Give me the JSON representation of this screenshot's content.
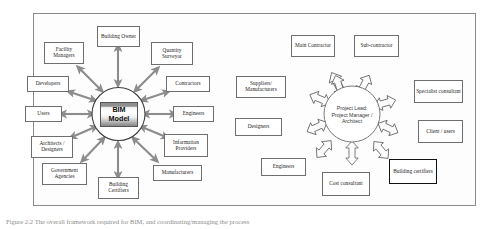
{
  "figure": {
    "caption": "Figure 2.2 The overall framework required for BIM, and coordinating/managing the process"
  },
  "left_diagram": {
    "hub": {
      "label_line1": "BIM",
      "label_line2": "Model"
    },
    "nodes": [
      {
        "id": "building-owner",
        "label": "Building Owner"
      },
      {
        "id": "facility-managers",
        "label": "Facility Managers"
      },
      {
        "id": "quantity-surveyor",
        "label": "Quantity Surveyor"
      },
      {
        "id": "developers",
        "label": "Developers"
      },
      {
        "id": "contractors",
        "label": "Contractors"
      },
      {
        "id": "users",
        "label": "Users"
      },
      {
        "id": "engineers",
        "label": "Engineers"
      },
      {
        "id": "architects-designers",
        "label": "Architects / Designers"
      },
      {
        "id": "information-providers",
        "label": "Information Providers"
      },
      {
        "id": "government-agencies",
        "label": "Government Agencies"
      },
      {
        "id": "manufacturers",
        "label": "Manufacturers"
      },
      {
        "id": "building-certifiers",
        "label": "Building Certifiers"
      }
    ]
  },
  "right_diagram": {
    "hub": {
      "label": "Project Lead: Project Manager / Architect"
    },
    "nodes": [
      {
        "id": "main-contractor",
        "label": "Main Contractor"
      },
      {
        "id": "sub-contractor",
        "label": "Sub-contractor"
      },
      {
        "id": "suppliers-manufacturers",
        "label": "Suppliers/ Manufacturers"
      },
      {
        "id": "specialist-consultant",
        "label": "Specialist consultant"
      },
      {
        "id": "designers",
        "label": "Designers"
      },
      {
        "id": "client-users",
        "label": "Client / users"
      },
      {
        "id": "engineers",
        "label": "Engineers"
      },
      {
        "id": "cost-consultant",
        "label": "Cost consultant"
      },
      {
        "id": "building-certifiers",
        "label": "Building certifiers"
      }
    ]
  },
  "style": {
    "frame_border": "#8a8a8a",
    "node_border": "#6e6e6e",
    "arrow_fill_left": "#8c8c8c",
    "arrow_outline_right": "#6b6b6b",
    "page_background": "#ffffff"
  }
}
